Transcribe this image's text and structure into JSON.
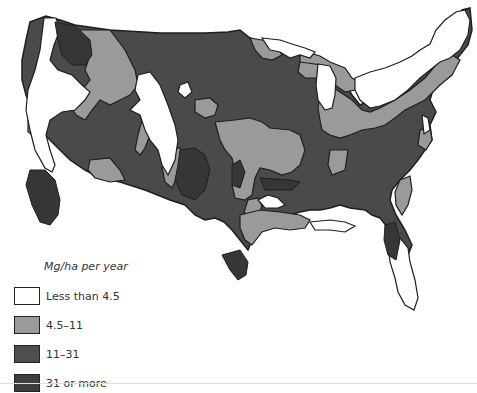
{
  "map": {
    "subject": "Contiguous United States",
    "colors": {
      "less_than_4_5": "#ffffff",
      "4_5_to_11": "#9a9a9a",
      "11_to_31": "#4e4e4e",
      "31_or_more": "#3e3e3e",
      "outline": "#1e1e1e"
    }
  },
  "legend": {
    "title": "Mg/ha per year",
    "items": [
      {
        "label": "Less than 4.5",
        "color": "#ffffff"
      },
      {
        "label": "4.5–11",
        "color": "#9a9a9a"
      },
      {
        "label": "11–31",
        "color": "#4e4e4e"
      },
      {
        "label": "31 or more",
        "color": "#3e3e3e"
      }
    ]
  }
}
